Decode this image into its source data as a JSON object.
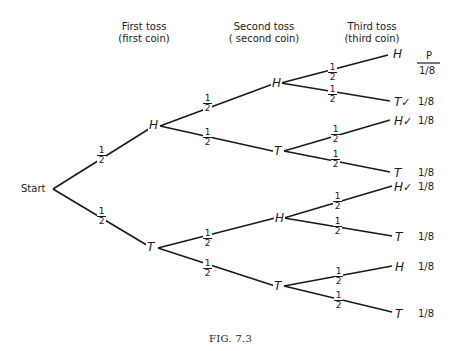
{
  "headers": {
    "first": {
      "line1": "First toss",
      "line2": "(first coin)"
    },
    "second": {
      "line1": "Second toss",
      "line2": "( second coin)"
    },
    "third": {
      "line1": "Third toss",
      "line2": "(third coin)"
    },
    "prob_col": "P"
  },
  "start_label": "Start",
  "branch_probability": {
    "num": "1",
    "den": "2"
  },
  "level1": [
    {
      "label": "H"
    },
    {
      "label": "T"
    }
  ],
  "level2": [
    {
      "label": "H"
    },
    {
      "label": "T"
    },
    {
      "label": "H"
    },
    {
      "label": "T"
    }
  ],
  "outcomes": [
    {
      "label": "H",
      "check": "",
      "p": "1/8"
    },
    {
      "label": "T",
      "check": "✓",
      "p": "1/8"
    },
    {
      "label": "H",
      "check": "✓",
      "p": "1/8"
    },
    {
      "label": "T",
      "check": "",
      "p": "1/8"
    },
    {
      "label": "H",
      "check": "✓",
      "p": "1/8"
    },
    {
      "label": "T",
      "check": "",
      "p": "1/8"
    },
    {
      "label": "H",
      "check": "",
      "p": "1/8"
    },
    {
      "label": "T",
      "check": "",
      "p": "1/8"
    }
  ],
  "caption": "FIG. 7.3"
}
